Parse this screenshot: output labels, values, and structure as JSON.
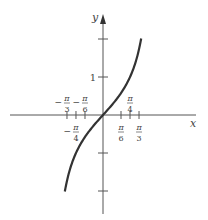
{
  "chart_data": {
    "type": "line",
    "title": "",
    "function": "y = tan(x)",
    "xlabel": "x",
    "ylabel": "y",
    "xlim": [
      -1.1,
      1.35
    ],
    "ylim": [
      -2.6,
      2.5
    ],
    "grid": false,
    "x_ticks": [
      {
        "value": -1.0472,
        "num": "π",
        "den": "3",
        "sign": "−",
        "pos": "above"
      },
      {
        "value": -0.7854,
        "num": "π",
        "den": "4",
        "sign": "−",
        "pos": "below"
      },
      {
        "value": -0.5236,
        "num": "π",
        "den": "6",
        "sign": "−",
        "pos": "above"
      },
      {
        "value": 0.5236,
        "num": "π",
        "den": "6",
        "sign": "",
        "pos": "below"
      },
      {
        "value": 0.7854,
        "num": "π",
        "den": "4",
        "sign": "",
        "pos": "above"
      },
      {
        "value": 1.0472,
        "num": "π",
        "den": "3",
        "sign": "",
        "pos": "below"
      }
    ],
    "y_ticks": [
      {
        "value": 2,
        "label": ""
      },
      {
        "value": 1,
        "label": "1"
      },
      {
        "value": -1,
        "label": ""
      },
      {
        "value": -2,
        "label": ""
      }
    ],
    "series": [
      {
        "name": "tan x",
        "x_range": [
          -1.11,
          1.11
        ],
        "color": "#333333"
      }
    ]
  },
  "axes": {
    "x_label": "x",
    "y_label": "y",
    "one_label": "1"
  }
}
